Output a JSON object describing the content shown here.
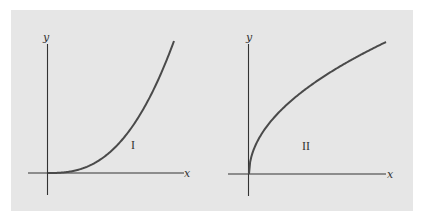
{
  "chart_data": [
    {
      "type": "line",
      "title": "",
      "annotation": "I",
      "xlabel": "x",
      "ylabel": "y",
      "grid": false,
      "description": "Concave-up increasing curve starting flat at origin (power-type, approx y = x^2.6)",
      "x": [
        0,
        0.25,
        0.5,
        0.6,
        0.75,
        0.9,
        1.0
      ],
      "values": [
        0,
        0.027,
        0.165,
        0.265,
        0.473,
        0.76,
        1.0
      ],
      "xlim": [
        -0.15,
        1.1
      ],
      "ylim": [
        -0.17,
        1.0
      ]
    },
    {
      "type": "line",
      "title": "",
      "annotation": "II",
      "xlabel": "x",
      "ylabel": "y",
      "grid": false,
      "description": "Concave-down increasing curve starting vertical at origin (square-root type, y = sqrt(x))",
      "x": [
        0,
        0.0625,
        0.25,
        0.5,
        0.75,
        1.0
      ],
      "values": [
        0,
        0.25,
        0.5,
        0.707,
        0.866,
        1.0
      ],
      "xlim": [
        -0.15,
        1.0
      ],
      "ylim": [
        -0.17,
        1.0
      ]
    }
  ],
  "plots": {
    "left": {
      "xlabel": "x",
      "ylabel": "y",
      "curve_label": "I"
    },
    "right": {
      "xlabel": "x",
      "ylabel": "y",
      "curve_label": "II"
    }
  },
  "colors": {
    "background": "#e6e6e6",
    "axis": "#333333",
    "curve": "#4a4a4a"
  }
}
